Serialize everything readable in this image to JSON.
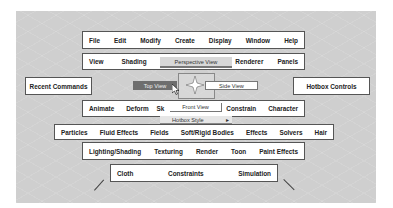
{
  "hotbox": {
    "menu_rows": {
      "main": [
        "File",
        "Edit",
        "Modify",
        "Create",
        "Display",
        "Window",
        "Help"
      ],
      "panel": [
        "View",
        "Shading",
        "",
        "Renderer",
        "Panels"
      ],
      "animation": [
        "Animate",
        "Deform",
        "Sk",
        "",
        "Constrain",
        "Character"
      ],
      "dynamics": [
        "Particles",
        "Fluid Effects",
        "Fields",
        "Soft/Rigid Bodies",
        "Effects",
        "Solvers",
        "Hair"
      ],
      "rendering": [
        "Lighting/Shading",
        "Texturing",
        "Render",
        "Toon",
        "Paint Effects"
      ],
      "cloth": [
        "Cloth",
        "Constraints",
        "Simulation"
      ]
    },
    "side_boxes": {
      "left": "Recent Commands",
      "right": "Hotbox Controls"
    },
    "marking_menu": {
      "north": "Perspective View",
      "west": "Top View",
      "east": "Side View",
      "south": "Front View",
      "south_sub": "Hotbox Style",
      "south_sub_arrow": "▸",
      "highlighted": "Top View"
    },
    "colors": {
      "background": "#cfcfcf",
      "menu_bg": "#ffffff",
      "highlight": "#6e6e6e"
    }
  }
}
